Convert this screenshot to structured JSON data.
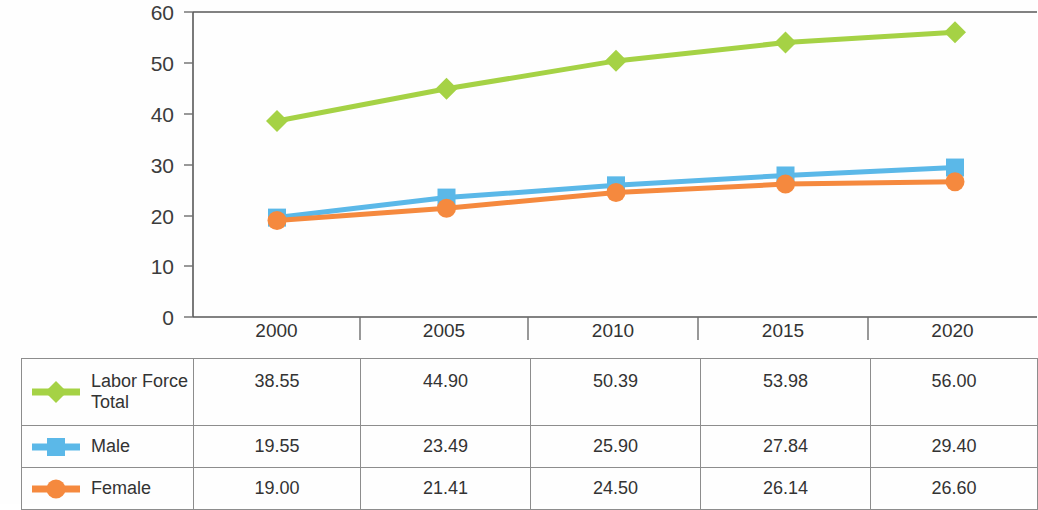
{
  "chart_data": {
    "type": "line",
    "title": "",
    "subtitle": "",
    "xlabel": "",
    "ylabel": "",
    "categories": [
      "2000",
      "2005",
      "2010",
      "2015",
      "2020"
    ],
    "ylim": [
      0,
      60
    ],
    "yticks": [
      0,
      10,
      20,
      30,
      40,
      50,
      60
    ],
    "grid": false,
    "legend_position": "data-table",
    "series": [
      {
        "name": "Labor Force Total",
        "name_line1": "Labor Force",
        "name_line2": "Total",
        "color": "#a5d245",
        "marker": "diamond",
        "values": [
          38.55,
          44.9,
          50.39,
          53.98,
          56.0
        ],
        "labels": [
          "38.55",
          "44.90",
          "50.39",
          "53.98",
          "56.00"
        ]
      },
      {
        "name": "Male",
        "name_line1": "Male",
        "name_line2": "",
        "color": "#5bb8e8",
        "marker": "square",
        "values": [
          19.55,
          23.49,
          25.9,
          27.84,
          29.4
        ],
        "labels": [
          "19.55",
          "23.49",
          "25.90",
          "27.84",
          "29.40"
        ]
      },
      {
        "name": "Female",
        "name_line1": "Female",
        "name_line2": "",
        "color": "#f5893e",
        "marker": "circle",
        "values": [
          19.0,
          21.41,
          24.5,
          26.14,
          26.6
        ],
        "labels": [
          "19.00",
          "21.41",
          "24.50",
          "26.14",
          "26.60"
        ]
      }
    ]
  },
  "table": {
    "header": [
      "",
      "2000",
      "2005",
      "2010",
      "2015",
      "2020"
    ],
    "rows": [
      {
        "legend_line1": "Labor Force",
        "legend_line2": "Total",
        "values": [
          "38.55",
          "44.90",
          "50.39",
          "53.98",
          "56.00"
        ]
      },
      {
        "legend_line1": "Male",
        "legend_line2": "",
        "values": [
          "19.55",
          "23.49",
          "25.90",
          "27.84",
          "29.40"
        ]
      },
      {
        "legend_line1": "Female",
        "legend_line2": "",
        "values": [
          "19.00",
          "21.41",
          "24.50",
          "26.14",
          "26.60"
        ]
      }
    ]
  },
  "colors": {
    "total": "#a5d245",
    "male": "#5bb8e8",
    "female": "#f5893e",
    "axis": "#595959",
    "grid_border": "#8d8d8d",
    "text": "#333333"
  }
}
